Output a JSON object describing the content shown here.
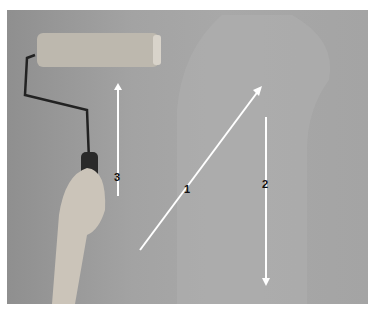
{
  "image": {
    "description": "Hand holding a paint roller against a wall with numbered arrows showing rolling pattern",
    "arrows": [
      {
        "label": "1",
        "direction": "diagonal-up-right"
      },
      {
        "label": "2",
        "direction": "down"
      },
      {
        "label": "3",
        "direction": "up"
      }
    ],
    "colors": {
      "wall": "#a5a5a5",
      "painted_area": "#adadad",
      "arrow": "#ffffff",
      "roller": "#b9b4ab",
      "handle": "#2b2b2b",
      "skin": "#c9c2b8"
    }
  }
}
